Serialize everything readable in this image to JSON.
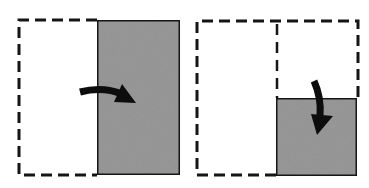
{
  "diagram": {
    "colors": {
      "background": "#ffffff",
      "stroke": "#111111",
      "fill": "#9a9a9a",
      "arrow": "#0d0d0d"
    },
    "panels": [
      {
        "id": "panel-1",
        "outline": {
          "style": "dashed",
          "x": 19,
          "y": 20,
          "w": 161,
          "h": 155
        },
        "shaded_region": {
          "x": 97,
          "y": 20,
          "w": 83,
          "h": 155,
          "label": "right half"
        },
        "arrow": {
          "direction": "right",
          "icon": "curved-arrow-right"
        }
      },
      {
        "id": "panel-2",
        "outline": {
          "style": "dashed",
          "x": 197,
          "y": 20,
          "w": 161,
          "h": 155
        },
        "divider": {
          "style": "dashed",
          "orientation": "vertical",
          "x": 277
        },
        "shaded_region": {
          "x": 276,
          "y": 98,
          "w": 81,
          "h": 78,
          "label": "bottom-right quadrant"
        },
        "arrow": {
          "direction": "down",
          "icon": "curved-arrow-down"
        }
      }
    ]
  }
}
